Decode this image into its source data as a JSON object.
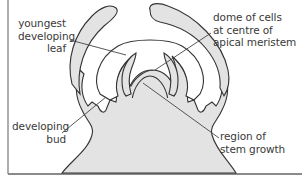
{
  "diagram": {
    "colors": {
      "tissue_fill": "#e3e3e3",
      "outline": "#333333",
      "frame": "#9a9a9a",
      "text": "#3a3a3a"
    },
    "labels": {
      "youngest_leaf": {
        "line1": "youngest",
        "line2": "developing",
        "line3": "leaf"
      },
      "dome": {
        "line1": "dome of cells",
        "line2": "at centre of",
        "line3": "apical meristem"
      },
      "bud": {
        "line1": "developing",
        "line2": "bud"
      },
      "stem_growth": {
        "line1": "region of",
        "line2": "stem growth"
      }
    }
  }
}
